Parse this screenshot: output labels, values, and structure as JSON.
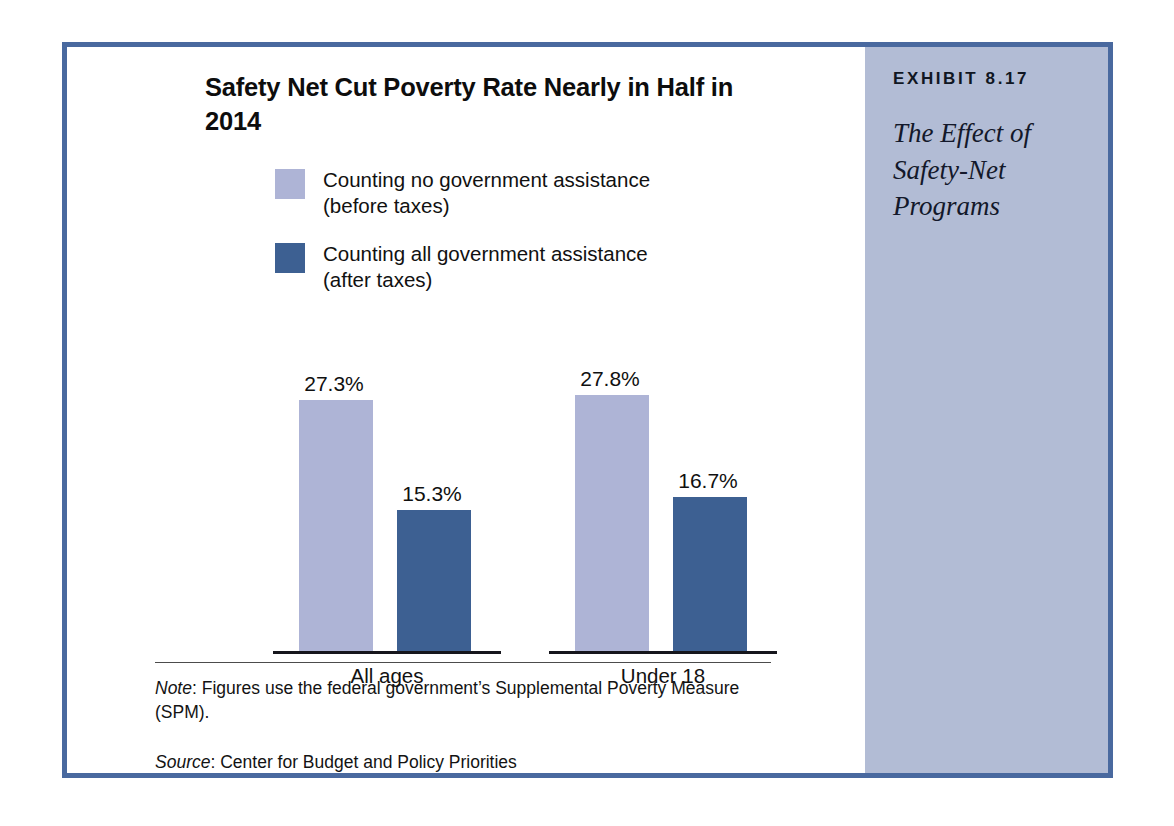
{
  "exhibit": {
    "label": "EXHIBIT 8.17",
    "title": "The Effect of Safety-Net Programs"
  },
  "legend": [
    {
      "swatch_color": "#aeb4d6",
      "line1": "Counting no government assistance",
      "line2": "(before taxes)"
    },
    {
      "swatch_color": "#3d6092",
      "line1": "Counting all government assistance",
      "line2": "(after taxes)"
    }
  ],
  "notes": {
    "note_lead": "Note",
    "note_text": ": Figures use the federal government’s Supplemental Poverty Measure (SPM).",
    "source_lead": "Source",
    "source_text": ": Center for Budget and Policy Priorities"
  },
  "chart_data": {
    "type": "bar",
    "title": "Safety Net Cut Poverty Rate Nearly in Half in 2014",
    "xlabel": "",
    "ylabel": "",
    "ylim": [
      0,
      30
    ],
    "grid": false,
    "legend_position": "top-left",
    "categories": [
      "All ages",
      "Under 18"
    ],
    "series": [
      {
        "name": "Counting no government assistance (before taxes)",
        "color": "#aeb4d6",
        "values": [
          27.3,
          27.8
        ],
        "labels": [
          "27.3%",
          "27.8%"
        ]
      },
      {
        "name": "Counting all government assistance (after taxes)",
        "color": "#3d6092",
        "values": [
          15.3,
          16.7
        ],
        "labels": [
          "15.3%",
          "16.7%"
        ]
      }
    ]
  }
}
